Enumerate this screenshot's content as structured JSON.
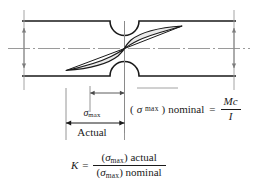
{
  "figure": {
    "background_color": "#ffffff",
    "line_color": "#1a1a1a",
    "centerline_color": "#9a9a9a",
    "dimension_color": "#7d7d7d"
  },
  "diagram": {
    "bar_label": "notched-bar",
    "notch_top_label": "top-semicircular-notch",
    "notch_bottom_label": "bottom-semicircular-notch",
    "stress_curve_label": "stress-distribution-curve",
    "centerline_label": "neutral-axis-centerline"
  },
  "annotations": {
    "sigma_symbol": "σ",
    "max_subscript": "max",
    "actual_text": "Actual"
  },
  "nominal_equation": {
    "sigma": "σ",
    "sub": "max",
    "open_paren": "(",
    "close_paren": ")",
    "word": "nominal",
    "equals": "=",
    "numerator": "Mc",
    "denominator": "I"
  },
  "k_equation": {
    "k": "K",
    "equals": "=",
    "num_sigma": "σ",
    "num_sub": "max",
    "num_word": "actual",
    "den_sigma": "σ",
    "den_sub": "max",
    "den_word": "nominal",
    "open_paren": "(",
    "close_paren": ")"
  }
}
